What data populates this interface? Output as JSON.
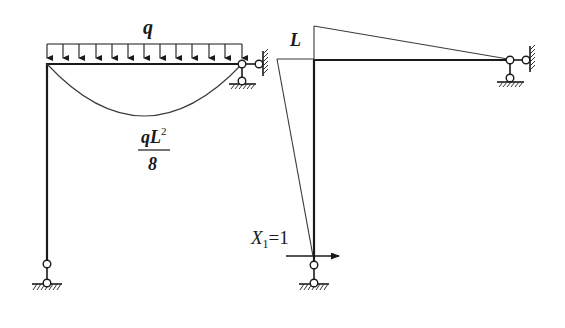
{
  "figure": {
    "left_panel": {
      "description": "Frame with uniformly distributed load on beam; moment diagram (parabola)",
      "load_label": "q",
      "moment_label_numerator": "qL",
      "moment_label_exponent": "2",
      "moment_label_denominator": "8"
    },
    "right_panel": {
      "description": "Unit load moment diagram for redundant X1",
      "dimension_label": "L",
      "unit_load_label_main": "X",
      "unit_load_label_sub": "1",
      "unit_load_label_value": "=1"
    }
  },
  "colors": {
    "line": "#1a1a1a",
    "diagram": "#3a3a3a",
    "background": "#ffffff"
  }
}
